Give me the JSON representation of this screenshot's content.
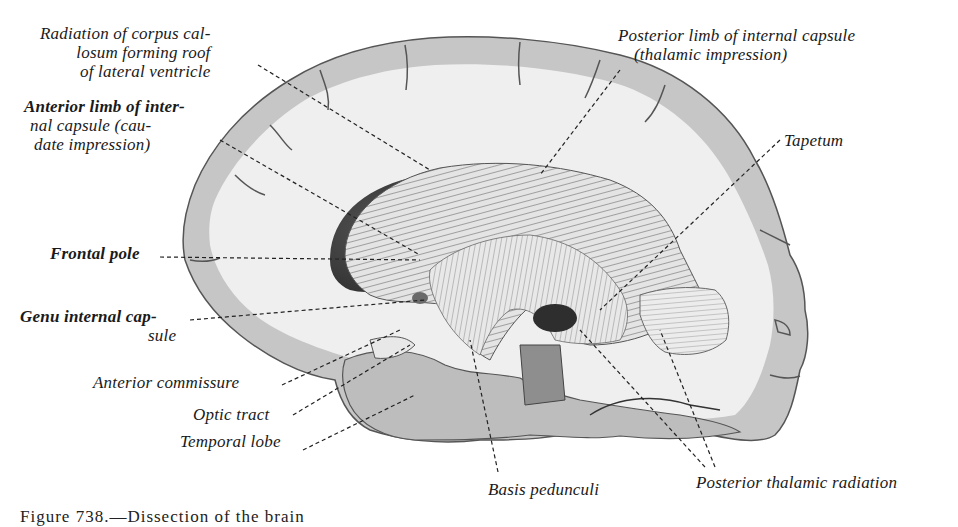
{
  "figure": {
    "caption_partial": "Figure 738.—Dissection of the brain",
    "caption_number": "738",
    "labels": {
      "radiation": [
        "Radiation of corpus cal-",
        "losum forming roof",
        "of lateral ventricle"
      ],
      "anterior_limb": [
        "Anterior limb of inter-",
        "nal capsule (cau-",
        "date impression)"
      ],
      "posterior_limb": [
        "Posterior limb of internal capsule",
        "(thalamic impression)"
      ],
      "tapetum": "Tapetum",
      "frontal_pole": "Frontal pole",
      "genu": [
        "Genu internal cap-",
        "sule"
      ],
      "anterior_commissure": "Anterior commissure",
      "optic_tract": "Optic tract",
      "temporal_lobe": "Temporal lobe",
      "basis_pedunculi": "Basis pedunculi",
      "posterior_thalamic_radiation": "Posterior thalamic radiation"
    },
    "colors": {
      "background": "#ffffff",
      "gray_matter": "#c9c9c9",
      "white_matter": "#eeeeee",
      "fibers": "#7a7a7a",
      "ventricle_dark": "#3a3a3a",
      "text": "#1a1a1a"
    }
  }
}
